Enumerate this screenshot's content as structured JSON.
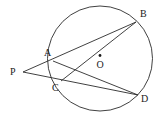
{
  "figure": {
    "kind": "circle-geometry-diagram",
    "width": 163,
    "height": 118,
    "background": "#ffffff",
    "stroke_color": "#2b2b2b",
    "label_color": "#1a1a1a",
    "stroke_width": 0.9
  },
  "circle": {
    "name": "circle-O",
    "cx": 100,
    "cy": 58.5,
    "r": 52.5,
    "fill": "none"
  },
  "center": {
    "name": "center-point-O",
    "x": 100,
    "y": 55.5,
    "dot_radius": 1.4,
    "label": "O",
    "label_x": 96.5,
    "label_y": 59.5
  },
  "points": [
    {
      "id": "P",
      "label": "P",
      "x": 23,
      "y": 72,
      "on_circle": false,
      "label_x": 10,
      "label_y": 67
    },
    {
      "id": "A",
      "label": "A",
      "x": 53,
      "y": 61,
      "on_circle": true,
      "label_x": 44,
      "label_y": 48
    },
    {
      "id": "B",
      "label": "B",
      "x": 136,
      "y": 22,
      "on_circle": true,
      "label_x": 140,
      "label_y": 9
    },
    {
      "id": "C",
      "label": "C",
      "x": 61,
      "y": 81,
      "on_circle": true,
      "label_x": 52,
      "label_y": 83
    },
    {
      "id": "D",
      "label": "D",
      "x": 138,
      "y": 95,
      "on_circle": true,
      "label_x": 141,
      "label_y": 94
    }
  ],
  "segments": [
    {
      "name": "secant-P-A-B",
      "from": "P",
      "to": "B",
      "x1": 23,
      "y1": 72,
      "x2": 136,
      "y2": 22
    },
    {
      "name": "secant-P-C-D",
      "from": "P",
      "to": "D",
      "x1": 23,
      "y1": 72,
      "x2": 138,
      "y2": 95
    },
    {
      "name": "chord-A-D",
      "from": "A",
      "to": "D",
      "x1": 53,
      "y1": 61,
      "x2": 138,
      "y2": 95
    },
    {
      "name": "chord-C-B",
      "from": "C",
      "to": "B",
      "x1": 61,
      "y1": 81,
      "x2": 136,
      "y2": 22
    }
  ]
}
